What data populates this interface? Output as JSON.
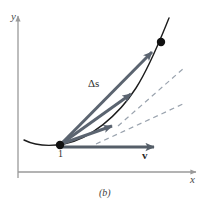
{
  "figure": {
    "caption": "(b)",
    "axes": {
      "y_label": "y",
      "x_label": "x",
      "axis_color": "#9a9a9a",
      "x_axis": {
        "x1": 18,
        "y1": 172,
        "x2": 196,
        "y2": 172
      },
      "y_axis": {
        "x1": 18,
        "y1": 178,
        "x2": 18,
        "y2": 16
      }
    },
    "labels": {
      "start_point": "1",
      "velocity": "v",
      "displacement": "Δs"
    },
    "points": [
      {
        "name": "start-point",
        "label": "1",
        "x": 60,
        "y": 145,
        "r": 4.2
      },
      {
        "name": "end-point",
        "label": "",
        "x": 161,
        "y": 42,
        "r": 4.2
      }
    ],
    "trajectory": {
      "name": "trajectory-curve",
      "color": "#1c1c1c",
      "width": 1.4,
      "path": "M 24 140 C 36 146 52 146 64 144 C 90 139 118 116 136 88 C 150 66 160 40 169 18"
    },
    "vectors": [
      {
        "name": "displacement-vector-long",
        "label": "Δs",
        "from": [
          61,
          144
        ],
        "to": [
          158,
          46
        ],
        "color": "#5b6470",
        "width": 3.0
      },
      {
        "name": "displacement-vector-mid",
        "label": "",
        "from": [
          61,
          144
        ],
        "to": [
          137,
          90
        ],
        "color": "#5b6470",
        "width": 3.0
      },
      {
        "name": "displacement-vector-short",
        "label": "",
        "from": [
          61,
          144
        ],
        "to": [
          118,
          124
        ],
        "color": "#5b6470",
        "width": 3.0
      },
      {
        "name": "velocity-vector",
        "label": "v",
        "from": [
          62,
          147
        ],
        "to": [
          162,
          147
        ],
        "color": "#555e68",
        "width": 3.0
      }
    ],
    "dashed_lines": [
      {
        "name": "tangent-dashed-upper",
        "from": [
          118,
          126
        ],
        "to": [
          184,
          68
        ],
        "color": "#9aa3ae",
        "width": 1.2,
        "dash": "5,4"
      },
      {
        "name": "tangent-dashed-lower",
        "from": [
          96,
          144
        ],
        "to": [
          183,
          104
        ],
        "color": "#9aa3ae",
        "width": 1.2,
        "dash": "5,4"
      }
    ],
    "colors": {
      "background": "#ffffff",
      "curve": "#1c1c1c",
      "vector": "#5b6470",
      "dashed": "#9aa3ae",
      "axis": "#9a9a9a",
      "text": "#2e2e2e"
    }
  }
}
